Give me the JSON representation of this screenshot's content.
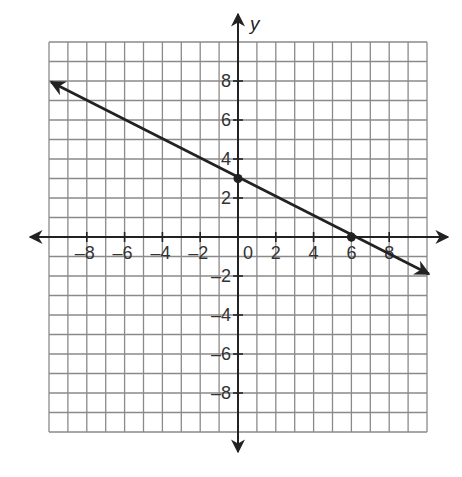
{
  "chart_data": {
    "type": "line",
    "title": "",
    "xlabel": "",
    "ylabel": "y",
    "xlim": [
      -10,
      10
    ],
    "ylim": [
      -10,
      10
    ],
    "grid": true,
    "grid_step": 1,
    "x_ticks": [
      -8,
      -6,
      -4,
      -2,
      0,
      2,
      4,
      6,
      8
    ],
    "x_tick_labels": [
      "–8",
      "–6",
      "–4",
      "–2",
      "0",
      "2",
      "4",
      "6",
      "8"
    ],
    "y_ticks": [
      8,
      6,
      4,
      2,
      -2,
      -4,
      -6,
      -8
    ],
    "y_tick_labels": [
      "8",
      "6",
      "4",
      "2",
      "–2",
      "–4",
      "–6",
      "–8"
    ],
    "series": [
      {
        "name": "line",
        "equation": "y = -0.5x + 3",
        "x": [
          -10,
          10
        ],
        "y": [
          8,
          -2
        ],
        "arrows_both_ends": true
      }
    ],
    "points": [
      {
        "x": 0,
        "y": 3,
        "label": "y-intercept"
      },
      {
        "x": 6,
        "y": 0,
        "label": "x-intercept"
      }
    ],
    "legend": null
  },
  "colors": {
    "grid": "#8a8a8a",
    "axis": "#222222",
    "line": "#222222",
    "background": "#ffffff"
  }
}
